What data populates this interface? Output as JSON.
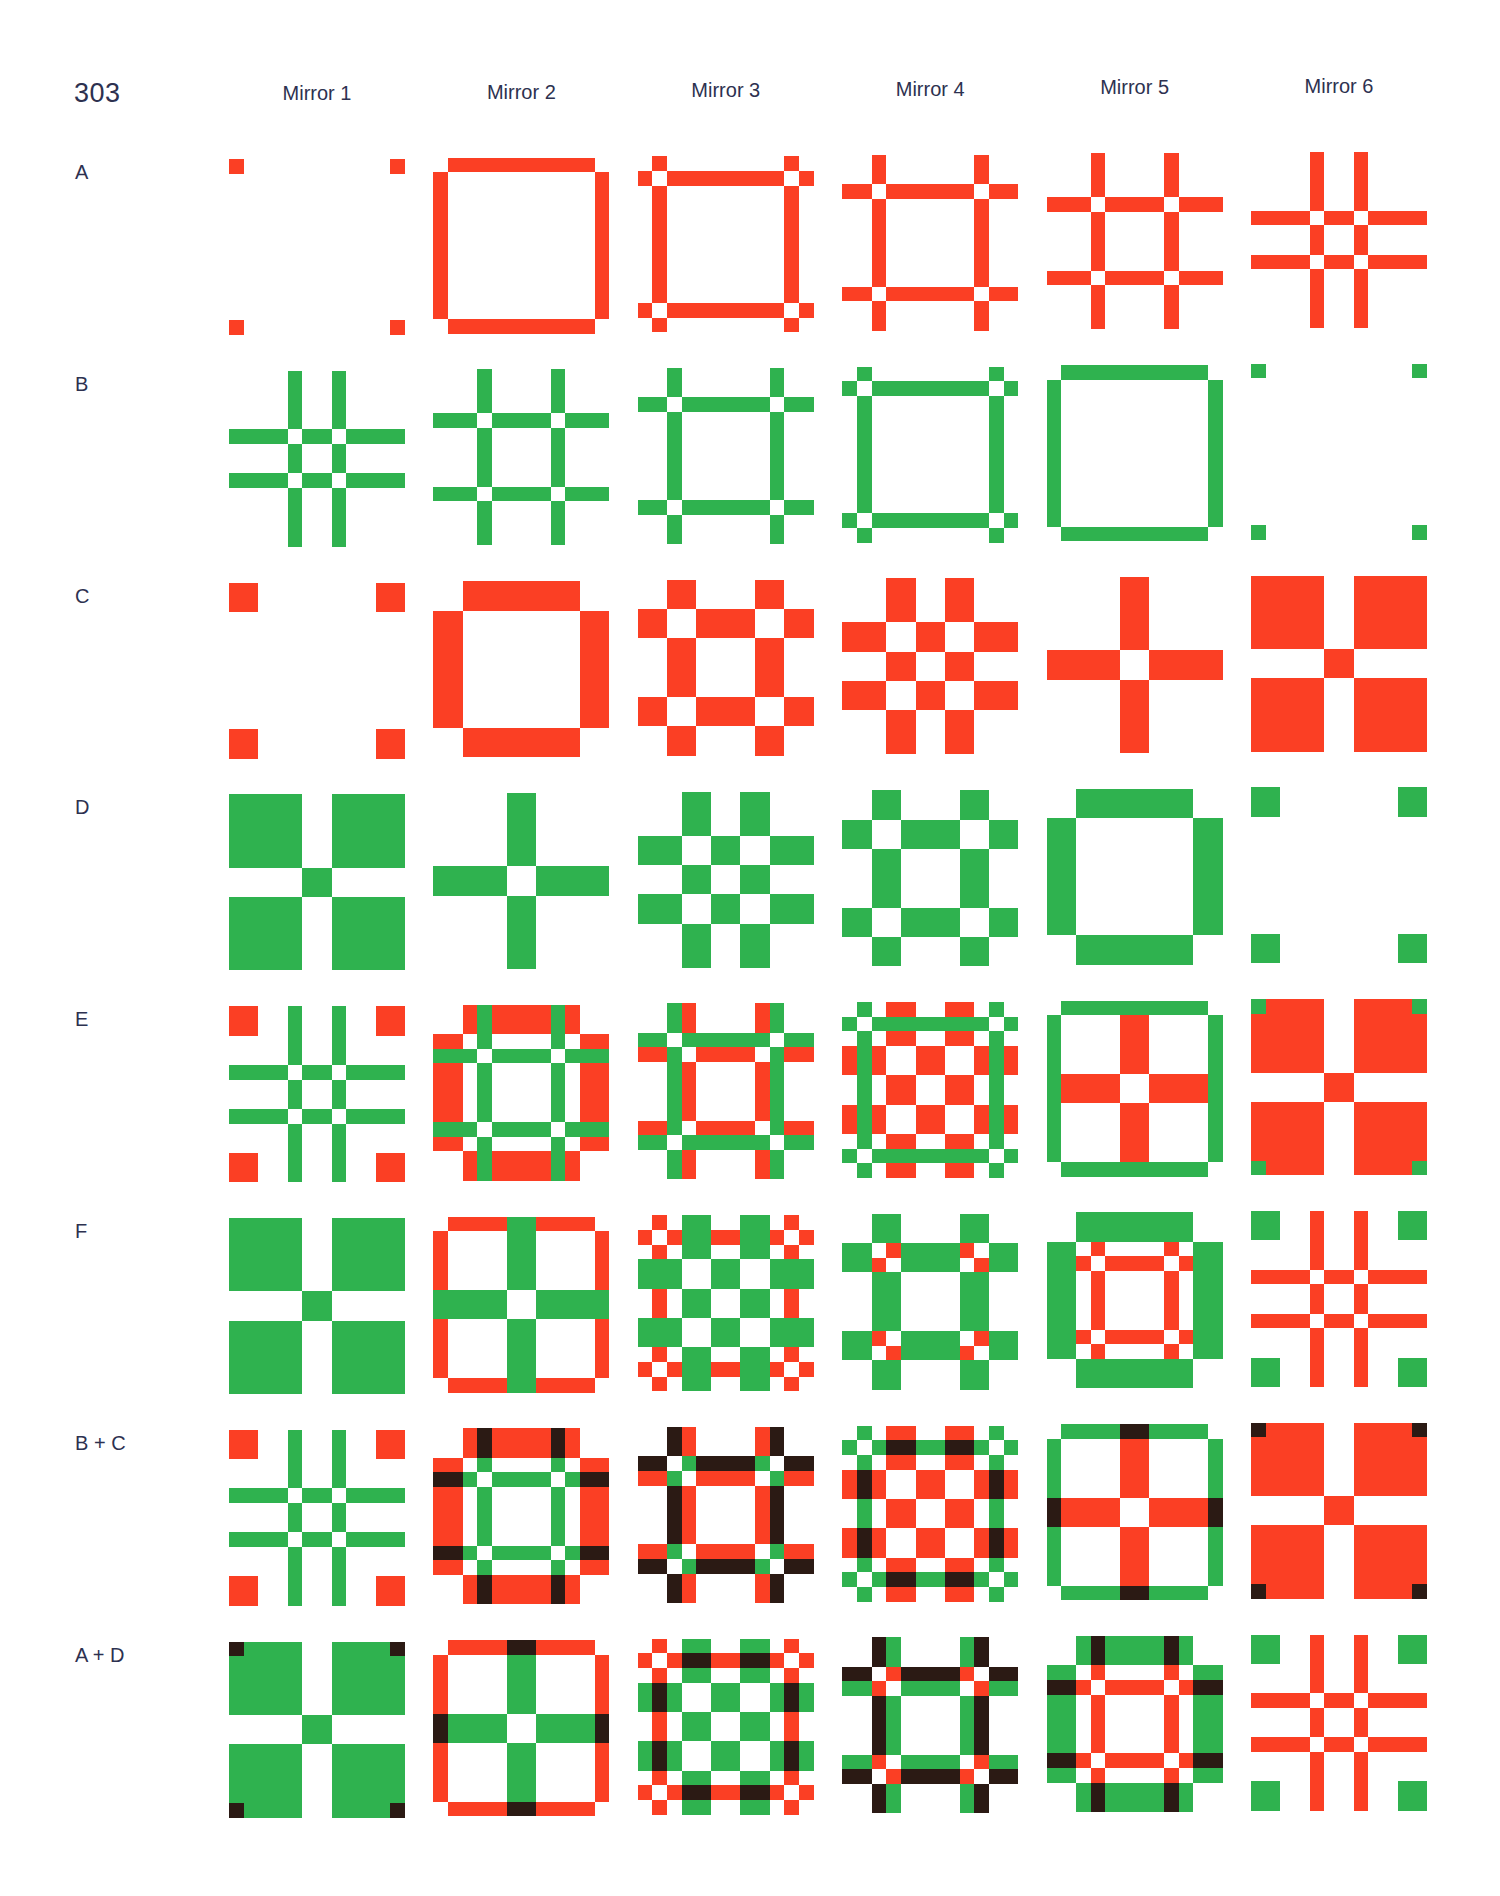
{
  "page_number": "303",
  "colors": {
    "red": "#fb3f24",
    "green": "#2fb24f",
    "overlap": "#2b1a14",
    "empty": "#ffffff",
    "text": "#2d3150"
  },
  "columns": [
    {
      "label": "Mirror 1"
    },
    {
      "label": "Mirror 2"
    },
    {
      "label": "Mirror 3"
    },
    {
      "label": "Mirror 4"
    },
    {
      "label": "Mirror 5"
    },
    {
      "label": "Mirror 6"
    }
  ],
  "base_patterns": {
    "A": {
      "color": "red",
      "tiles": [
        [
          "#..........#",
          "............",
          "............",
          "............",
          "............",
          "............",
          "............",
          "............",
          "............",
          "............",
          "............",
          "#..........#"
        ],
        [
          ".##########.",
          "#..........#",
          "#..........#",
          "#..........#",
          "#..........#",
          "#..........#",
          "#..........#",
          "#..........#",
          "#..........#",
          "#..........#",
          "#..........#",
          ".##########."
        ],
        [
          ".#........#.",
          "#.########.#",
          ".#........#.",
          ".#........#.",
          ".#........#.",
          ".#........#.",
          ".#........#.",
          ".#........#.",
          ".#........#.",
          ".#........#.",
          "#.########.#",
          ".#........#."
        ],
        [
          "..#......#..",
          "..#......#..",
          "##.######.##",
          "..#......#..",
          "..#......#..",
          "..#......#..",
          "..#......#..",
          "..#......#..",
          "..#......#..",
          "##.######.##",
          "..#......#..",
          "..#......#.."
        ],
        [
          "...#....#...",
          "...#....#...",
          "...#....#...",
          "###.####.###",
          "...#....#...",
          "...#....#...",
          "...#....#...",
          "...#....#...",
          "###.####.###",
          "...#....#...",
          "...#....#...",
          "...#....#..."
        ],
        [
          "....#..#....",
          "....#..#....",
          "....#..#....",
          "....#..#....",
          "####.##.####",
          "....#..#....",
          "....#..#....",
          "####.##.####",
          "....#..#....",
          "....#..#....",
          "....#..#....",
          "....#..#...."
        ]
      ]
    },
    "B": {
      "color": "green",
      "tiles": [
        [
          "....#..#....",
          "....#..#....",
          "....#..#....",
          "....#..#....",
          "####.##.####",
          "....#..#....",
          "....#..#....",
          "####.##.####",
          "....#..#....",
          "....#..#....",
          "....#..#....",
          "....#..#...."
        ],
        [
          "...#....#...",
          "...#....#...",
          "...#....#...",
          "###.####.###",
          "...#....#...",
          "...#....#...",
          "...#....#...",
          "...#....#...",
          "###.####.###",
          "...#....#...",
          "...#....#...",
          "...#....#..."
        ],
        [
          "..#......#..",
          "..#......#..",
          "##.######.##",
          "..#......#..",
          "..#......#..",
          "..#......#..",
          "..#......#..",
          "..#......#..",
          "..#......#..",
          "##.######.##",
          "..#......#..",
          "..#......#.."
        ],
        [
          ".#........#.",
          "#.########.#",
          ".#........#.",
          ".#........#.",
          ".#........#.",
          ".#........#.",
          ".#........#.",
          ".#........#.",
          ".#........#.",
          ".#........#.",
          "#.########.#",
          ".#........#."
        ],
        [
          ".##########.",
          "#..........#",
          "#..........#",
          "#..........#",
          "#..........#",
          "#..........#",
          "#..........#",
          "#..........#",
          "#..........#",
          "#..........#",
          "#..........#",
          ".##########."
        ],
        [
          "#..........#",
          "............",
          "............",
          "............",
          "............",
          "............",
          "............",
          "............",
          "............",
          "............",
          "............",
          "#..........#"
        ]
      ]
    },
    "C": {
      "color": "red",
      "tiles": [
        [
          "##........##",
          "##........##",
          "............",
          "............",
          "............",
          "............",
          "............",
          "............",
          "............",
          "............",
          "##........##",
          "##........##"
        ],
        [
          "..########..",
          "..########..",
          "##........##",
          "##........##",
          "##........##",
          "##........##",
          "##........##",
          "##........##",
          "##........##",
          "##........##",
          "..########..",
          "..########.."
        ],
        [
          "..##....##..",
          "..##....##..",
          "##..####..##",
          "##..####..##",
          "..##....##..",
          "..##....##..",
          "..##....##..",
          "..##....##..",
          "##..####..##",
          "##..####..##",
          "..##....##..",
          "..##....##.."
        ],
        [
          "...##..##...",
          "...##..##...",
          "...##..##...",
          "###..##..###",
          "###..##..###",
          "...##..##...",
          "...##..##...",
          "###..##..###",
          "###..##..###",
          "...##..##...",
          "...##..##...",
          "...##..##..."
        ],
        [
          ".....##.....",
          ".....##.....",
          ".....##.....",
          ".....##.....",
          ".....##.....",
          "#####..#####",
          "#####..#####",
          ".....##.....",
          ".....##.....",
          ".....##.....",
          ".....##.....",
          ".....##....."
        ],
        [
          "#####..#####",
          "#####..#####",
          "#####..#####",
          "#####..#####",
          "#####..#####",
          ".....##.....",
          ".....##.....",
          "#####..#####",
          "#####..#####",
          "#####..#####",
          "#####..#####",
          "#####..#####"
        ]
      ]
    },
    "D": {
      "color": "green",
      "tiles": [
        [
          "#####..#####",
          "#####..#####",
          "#####..#####",
          "#####..#####",
          "#####..#####",
          ".....##.....",
          ".....##.....",
          "#####..#####",
          "#####..#####",
          "#####..#####",
          "#####..#####",
          "#####..#####"
        ],
        [
          ".....##.....",
          ".....##.....",
          ".....##.....",
          ".....##.....",
          ".....##.....",
          "#####..#####",
          "#####..#####",
          ".....##.....",
          ".....##.....",
          ".....##.....",
          ".....##.....",
          ".....##....."
        ],
        [
          "...##..##...",
          "...##..##...",
          "...##..##...",
          "###..##..###",
          "###..##..###",
          "...##..##...",
          "...##..##...",
          "###..##..###",
          "###..##..###",
          "...##..##...",
          "...##..##...",
          "...##..##..."
        ],
        [
          "..##....##..",
          "..##....##..",
          "##..####..##",
          "##..####..##",
          "..##....##..",
          "..##....##..",
          "..##....##..",
          "..##....##..",
          "##..####..##",
          "##..####..##",
          "..##....##..",
          "..##....##.."
        ],
        [
          "..########..",
          "..########..",
          "##........##",
          "##........##",
          "##........##",
          "##........##",
          "##........##",
          "##........##",
          "##........##",
          "##........##",
          "..########..",
          "..########.."
        ],
        [
          "##........##",
          "##........##",
          "............",
          "............",
          "............",
          "............",
          "............",
          "............",
          "............",
          "............",
          "##........##",
          "##........##"
        ]
      ]
    }
  },
  "rows": [
    {
      "label": "A",
      "layers": [
        "A"
      ],
      "mode": "single"
    },
    {
      "label": "B",
      "layers": [
        "B"
      ],
      "mode": "single"
    },
    {
      "label": "C",
      "layers": [
        "C"
      ],
      "mode": "single"
    },
    {
      "label": "D",
      "layers": [
        "D"
      ],
      "mode": "single"
    },
    {
      "label": "E",
      "layers": [
        "C",
        "B"
      ],
      "mode": "green-over-red"
    },
    {
      "label": "F",
      "layers": [
        "A",
        "D"
      ],
      "mode": "green-over-red"
    },
    {
      "label": "B + C",
      "layers": [
        "C",
        "B"
      ],
      "mode": "multiply"
    },
    {
      "label": "A + D",
      "layers": [
        "A",
        "D"
      ],
      "mode": "multiply"
    }
  ]
}
